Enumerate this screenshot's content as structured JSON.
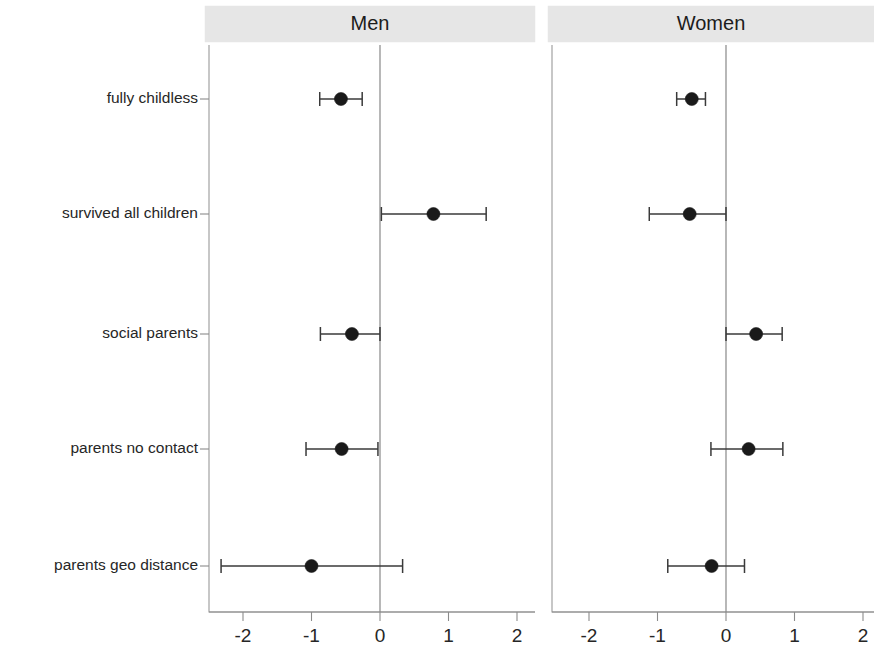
{
  "chart_data": {
    "type": "scatter",
    "title": "",
    "subtitle": "",
    "xlabel": "",
    "ylabel": "",
    "xlim": [
      -2.6,
      2.3
    ],
    "xticks": [
      -2,
      -1,
      0,
      1,
      2
    ],
    "xticklabels": [
      "-2",
      "-1",
      "0",
      "1",
      "2"
    ],
    "grid": false,
    "legend": "none",
    "reference_line": 0,
    "categories": [
      "fully childless",
      "survived all children",
      "social parents",
      "parents no contact",
      "parents geo distance"
    ],
    "panels": [
      {
        "label": "Men",
        "estimates": [
          -0.57,
          0.78,
          -0.41,
          -0.56,
          -1.0
        ],
        "ci_low": [
          -0.88,
          0.02,
          -0.87,
          -1.08,
          -2.32
        ],
        "ci_high": [
          -0.26,
          1.55,
          0.0,
          -0.03,
          0.33
        ]
      },
      {
        "label": "Women",
        "estimates": [
          -0.5,
          -0.53,
          0.44,
          0.33,
          -0.21
        ],
        "ci_low": [
          -0.72,
          -1.12,
          0.0,
          -0.22,
          -0.85
        ],
        "ci_high": [
          -0.3,
          0.0,
          0.82,
          0.83,
          0.27
        ]
      }
    ],
    "series": [
      {
        "name": "Men",
        "values": [
          -0.57,
          0.78,
          -0.41,
          -0.56,
          -1.0
        ]
      },
      {
        "name": "Women",
        "values": [
          -0.5,
          -0.53,
          0.44,
          0.33,
          -0.21
        ]
      }
    ],
    "colors": {
      "point": "#1a1a1a",
      "interval": "#3a3a3a",
      "strip_background": "#e6e6e6",
      "panel_border": "#9a9a9a",
      "axis": "#8b8b8b"
    }
  },
  "panel_men": {
    "label": "Men"
  },
  "panel_women": {
    "label": "Women"
  }
}
